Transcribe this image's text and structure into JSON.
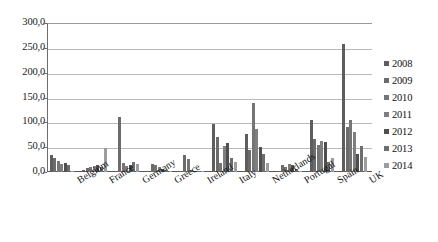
{
  "chart_data": {
    "type": "bar",
    "title": "",
    "xlabel": "",
    "ylabel": "",
    "ylim": [
      0,
      300
    ],
    "ytick_labels": [
      "300,0",
      "250,0",
      "200,0",
      "150,0",
      "100,0",
      "50,0",
      "0,0"
    ],
    "ytick_values": [
      300,
      250,
      200,
      150,
      100,
      50,
      0
    ],
    "grid": true,
    "legend_position": "right",
    "categories": [
      "Belgium",
      "France",
      "Germany",
      "Greece",
      "Ireland",
      "Italy",
      "Netherlands",
      "Portugal",
      "Spain",
      "UK"
    ],
    "series": [
      {
        "name": "2008",
        "color": "#5e5e5e",
        "values": [
          35.0,
          4.0,
          3.0,
          2.0,
          1.0,
          96.0,
          77.0,
          3.0,
          104.0,
          258.0
        ]
      },
      {
        "name": "2009",
        "color": "#6b6b6b",
        "values": [
          28.0,
          9.0,
          110.0,
          16.0,
          35.0,
          70.0,
          45.0,
          15.0,
          66.0,
          90.0
        ]
      },
      {
        "name": "2010",
        "color": "#757575",
        "values": [
          22.0,
          10.0,
          19.0,
          14.0,
          27.0,
          19.0,
          138.0,
          11.0,
          55.0,
          104.0
        ]
      },
      {
        "name": "2011",
        "color": "#7f7f7f",
        "values": [
          16.0,
          12.0,
          13.0,
          10.0,
          4.0,
          52.0,
          86.0,
          16.0,
          62.0,
          80.0
        ]
      },
      {
        "name": "2012",
        "color": "#4f4f4f",
        "values": [
          18.0,
          15.0,
          14.0,
          6.0,
          2.0,
          59.0,
          50.0,
          14.0,
          60.0,
          36.0
        ]
      },
      {
        "name": "2013",
        "color": "#6d6d6d",
        "values": [
          15.0,
          10.0,
          20.0,
          5.0,
          1.0,
          29.0,
          37.0,
          6.0,
          21.0,
          52.0
        ]
      },
      {
        "name": "2014",
        "color": "#9c9c9c",
        "values": [
          3.0,
          48.0,
          17.0,
          3.0,
          1.0,
          20.0,
          18.0,
          3.0,
          29.0,
          30.0
        ]
      }
    ]
  }
}
